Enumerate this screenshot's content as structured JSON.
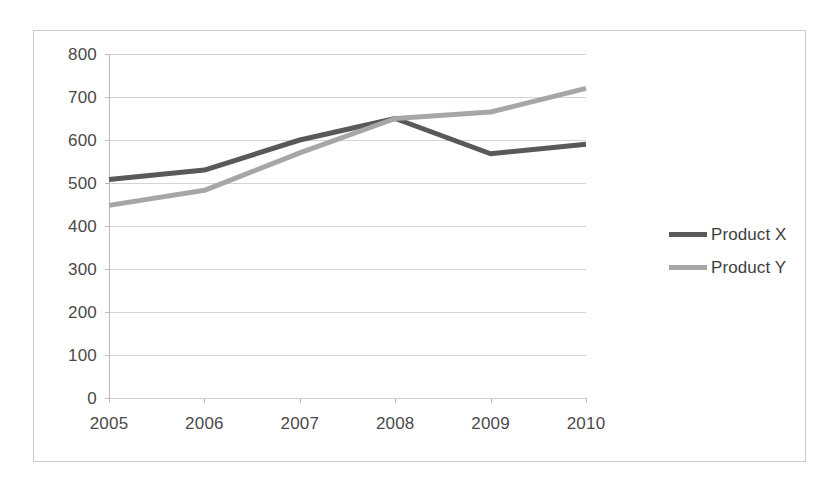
{
  "chart_data": {
    "type": "line",
    "title": "",
    "xlabel": "",
    "ylabel": "",
    "categories": [
      "2005",
      "2006",
      "2007",
      "2008",
      "2009",
      "2010"
    ],
    "series": [
      {
        "name": "Product X",
        "color": "#595959",
        "values": [
          508,
          530,
          600,
          650,
          568,
          590
        ]
      },
      {
        "name": "Product Y",
        "color": "#a6a6a6",
        "values": [
          448,
          483,
          570,
          650,
          665,
          720
        ]
      }
    ],
    "ylim": [
      0,
      800
    ],
    "ytick_step": 100,
    "yticks": [
      800,
      700,
      600,
      500,
      400,
      300,
      200,
      100,
      0
    ],
    "grid": true,
    "legend_position": "right"
  },
  "legend": {
    "entries": [
      {
        "label": "Product X"
      },
      {
        "label": "Product Y"
      }
    ]
  },
  "colors": {
    "product_x": "#595959",
    "product_y": "#a6a6a6",
    "gridline": "#d4d4d4",
    "axis": "#b9b9b9",
    "frame": "#c9c9c9",
    "tick_text": "#4a4a4a"
  }
}
